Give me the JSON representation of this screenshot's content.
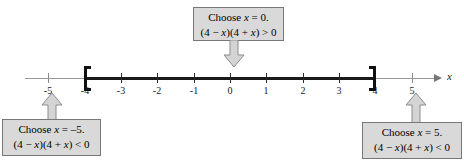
{
  "figure": {
    "type": "number-line-sign-chart",
    "axis_variable": "x",
    "colors": {
      "box_fill": "#d9d9d9",
      "box_border": "#777777",
      "axis_light": "#999999",
      "axis_bold": "#1a1a1a",
      "arrow_fill": "#d4d4d4",
      "arrow_stroke": "#8c8c8c"
    }
  },
  "number_line": {
    "tick_values": [
      "-5",
      "-4",
      "-3",
      "-2",
      "-1",
      "0",
      "1",
      "2",
      "3",
      "4",
      "5"
    ],
    "interval_start": "-4",
    "interval_end": "4",
    "interval_closed": true,
    "axis_label": "x"
  },
  "callouts": {
    "top": {
      "line1": "Choose x = 0.",
      "line2": "(4 − x)(4 + x) > 0",
      "arrow_direction": "down",
      "points_to": "0"
    },
    "left": {
      "line1": "Choose x = –5.",
      "line2": "(4 − x)(4 + x) < 0",
      "arrow_direction": "up",
      "points_to": "-5"
    },
    "right": {
      "line1": "Choose x = 5.",
      "line2": "(4 − x)(4 + x) < 0",
      "arrow_direction": "up",
      "points_to": "5"
    }
  }
}
